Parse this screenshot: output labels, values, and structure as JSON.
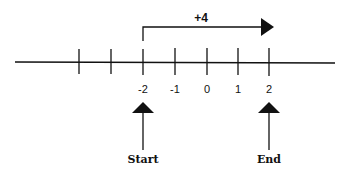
{
  "diagram": {
    "type": "number-line",
    "jump_label": "+4",
    "tick_labels": [
      "-2",
      "-1",
      "0",
      "1",
      "2"
    ],
    "start_label": "Start",
    "end_label": "End",
    "start_value": -2,
    "end_value": 2,
    "jump_value": 4,
    "color": "#111111"
  }
}
